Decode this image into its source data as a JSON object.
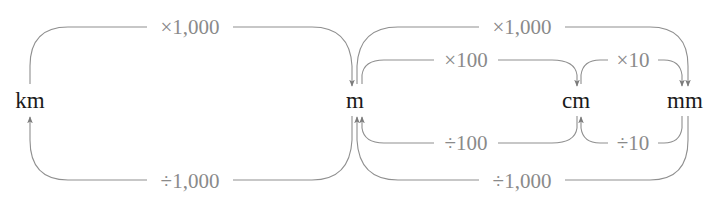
{
  "units": {
    "km": "km",
    "m": "m",
    "cm": "cm",
    "mm": "mm"
  },
  "conversions": [
    {
      "id": "km_to_m",
      "from": "km",
      "to": "m",
      "label": "×1,000",
      "position": "top-outer"
    },
    {
      "id": "m_to_km",
      "from": "m",
      "to": "km",
      "label": "÷1,000",
      "position": "bottom-outer"
    },
    {
      "id": "m_to_mm",
      "from": "m",
      "to": "mm",
      "label": "×1,000",
      "position": "top-outer"
    },
    {
      "id": "m_to_cm",
      "from": "m",
      "to": "cm",
      "label": "×100",
      "position": "top-inner"
    },
    {
      "id": "cm_to_mm",
      "from": "cm",
      "to": "mm",
      "label": "×10",
      "position": "top-inner"
    },
    {
      "id": "cm_to_m",
      "from": "cm",
      "to": "m",
      "label": "÷100",
      "position": "bottom-inner"
    },
    {
      "id": "mm_to_cm",
      "from": "mm",
      "to": "cm",
      "label": "÷10",
      "position": "bottom-inner"
    },
    {
      "id": "mm_to_m",
      "from": "mm",
      "to": "m",
      "label": "÷1,000",
      "position": "bottom-outer"
    }
  ],
  "colors": {
    "unit_text": "#1a1a1a",
    "operation_text": "#8a8a8a",
    "arrow_line": "#8f8f8f"
  }
}
